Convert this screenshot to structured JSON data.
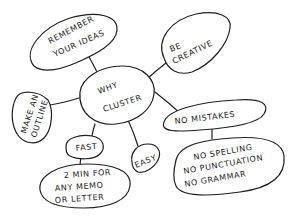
{
  "diagram": {
    "type": "cluster / mind map",
    "style": "hand-drawn, black ink on white",
    "colors": {
      "ink": "#1e1e1e",
      "background": "#ffffff"
    },
    "center": {
      "id": "why-cluster",
      "lines": [
        "WHY",
        "CLUSTER"
      ]
    },
    "nodes": [
      {
        "id": "remember-ideas",
        "lines": [
          "REMEMBER",
          "YOUR IDEAS"
        ],
        "parent": "why-cluster"
      },
      {
        "id": "be-creative",
        "lines": [
          "BE",
          "CREATIVE"
        ],
        "parent": "why-cluster"
      },
      {
        "id": "make-outline",
        "lines": [
          "MAKE AN",
          "OUTLINE"
        ],
        "parent": "why-cluster"
      },
      {
        "id": "no-mistakes",
        "lines": [
          "NO MISTAKES"
        ],
        "parent": "why-cluster"
      },
      {
        "id": "fast",
        "lines": [
          "FAST"
        ],
        "parent": "why-cluster"
      },
      {
        "id": "easy",
        "lines": [
          "EASY"
        ],
        "parent": "why-cluster"
      },
      {
        "id": "two-min",
        "lines": [
          "2 MIN FOR",
          "ANY MEMO",
          "OR LETTER"
        ],
        "parent": "fast"
      },
      {
        "id": "no-spelling",
        "lines": [
          "NO SPELLING",
          "NO PUNCTUATION",
          "NO GRAMMAR"
        ],
        "parent": "no-mistakes"
      }
    ]
  }
}
